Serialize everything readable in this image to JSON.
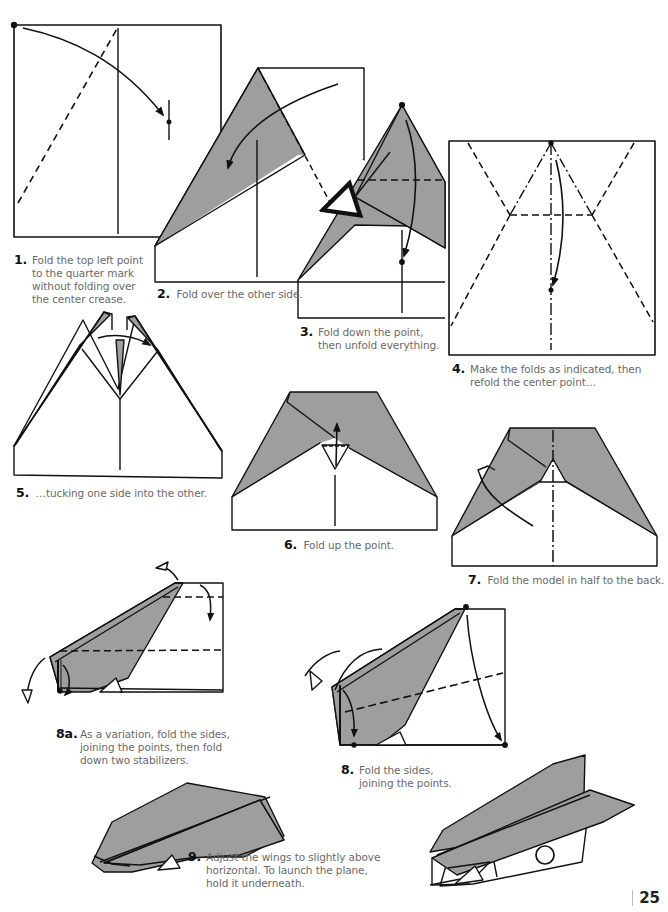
{
  "page": {
    "number": "25",
    "colors": {
      "paper_fill": "#9e9e9e",
      "line": "#111111",
      "caption_text": "#6a6a6a",
      "step_number": "#111111"
    }
  },
  "steps": [
    {
      "id": "1",
      "num": "1.",
      "text": "Fold the top left point to the quarter mark without folding over the center crease."
    },
    {
      "id": "2",
      "num": "2.",
      "text": "Fold over the other side."
    },
    {
      "id": "3",
      "num": "3.",
      "text": "Fold down the point, then unfold everything."
    },
    {
      "id": "4",
      "num": "4.",
      "text": "Make the folds as indicated, then refold the center point…"
    },
    {
      "id": "5",
      "num": "5.",
      "text": "…tucking one side into the other."
    },
    {
      "id": "6",
      "num": "6.",
      "text": "Fold up the point."
    },
    {
      "id": "7",
      "num": "7.",
      "text": "Fold the model in half to the back."
    },
    {
      "id": "8a",
      "num": "8a.",
      "text": "As a variation, fold the sides, joining the points, then fold down two stabilizers."
    },
    {
      "id": "8",
      "num": "8.",
      "text": "Fold the sides, joining the points."
    },
    {
      "id": "9",
      "num": "9.",
      "text": "Adjust the wings to slightly above horizontal. To launch the plane, hold it underneath."
    }
  ],
  "diagrams": [
    {
      "step": "1",
      "icons": [
        "fold-arrow-icon",
        "valley-fold-line",
        "quarter-mark"
      ]
    },
    {
      "step": "2",
      "icons": [
        "fold-arrow-icon",
        "valley-fold-line"
      ]
    },
    {
      "step": "3",
      "icons": [
        "fold-arrow-icon",
        "unfold-arrow-icon",
        "valley-fold-line"
      ]
    },
    {
      "step": "4",
      "icons": [
        "fold-arrow-icon",
        "mountain-fold-line",
        "valley-fold-line"
      ]
    },
    {
      "step": "5",
      "icons": [
        "tuck-arrow-icon"
      ]
    },
    {
      "step": "6",
      "icons": [
        "fold-up-arrow-icon",
        "valley-fold-line"
      ]
    },
    {
      "step": "7",
      "icons": [
        "fold-behind-arrow-icon",
        "mountain-fold-line"
      ]
    },
    {
      "step": "8a",
      "icons": [
        "fold-arrow-icon",
        "fold-behind-arrow-icon",
        "valley-fold-line"
      ]
    },
    {
      "step": "8",
      "icons": [
        "fold-arrow-icon",
        "fold-behind-arrow-icon",
        "valley-fold-line"
      ]
    },
    {
      "step": "9",
      "icons": [
        "paper-airplane"
      ]
    }
  ]
}
